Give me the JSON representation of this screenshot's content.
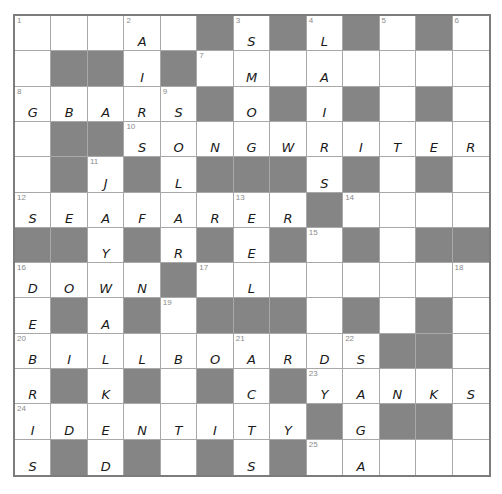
{
  "puzzle": {
    "rows": 13,
    "cols": 13,
    "colors": {
      "block": "#858585",
      "gridline": "#a8a8a8",
      "border": "#7c7c7c",
      "number": "#8a8a8a",
      "letter": "#1a1a1a"
    },
    "grid": [
      [
        {
          "n": "1",
          "l": ""
        },
        {
          "n": "",
          "l": ""
        },
        {
          "n": "",
          "l": ""
        },
        {
          "n": "2",
          "l": "A"
        },
        {
          "n": "",
          "l": ""
        },
        {
          "b": true
        },
        {
          "n": "3",
          "l": "S"
        },
        {
          "b": true
        },
        {
          "n": "4",
          "l": "L"
        },
        {
          "b": true
        },
        {
          "n": "5",
          "l": ""
        },
        {
          "b": true
        },
        {
          "n": "6",
          "l": ""
        }
      ],
      [
        {
          "n": "",
          "l": ""
        },
        {
          "b": true
        },
        {
          "b": true
        },
        {
          "n": "",
          "l": "I"
        },
        {
          "b": true
        },
        {
          "n": "7",
          "l": ""
        },
        {
          "n": "",
          "l": "M"
        },
        {
          "n": "",
          "l": ""
        },
        {
          "n": "",
          "l": "A"
        },
        {
          "n": "",
          "l": ""
        },
        {
          "n": "",
          "l": ""
        },
        {
          "n": "",
          "l": ""
        },
        {
          "n": "",
          "l": ""
        }
      ],
      [
        {
          "n": "8",
          "l": "G"
        },
        {
          "n": "",
          "l": "B"
        },
        {
          "n": "",
          "l": "A"
        },
        {
          "n": "",
          "l": "R"
        },
        {
          "n": "9",
          "l": "S"
        },
        {
          "b": true
        },
        {
          "n": "",
          "l": "O"
        },
        {
          "b": true
        },
        {
          "n": "",
          "l": "I"
        },
        {
          "b": true
        },
        {
          "n": "",
          "l": ""
        },
        {
          "b": true
        },
        {
          "n": "",
          "l": ""
        }
      ],
      [
        {
          "n": "",
          "l": ""
        },
        {
          "b": true
        },
        {
          "b": true
        },
        {
          "n": "10",
          "l": "S"
        },
        {
          "n": "",
          "l": "O"
        },
        {
          "n": "",
          "l": "N"
        },
        {
          "n": "",
          "l": "G"
        },
        {
          "n": "",
          "l": "W"
        },
        {
          "n": "",
          "l": "R"
        },
        {
          "n": "",
          "l": "I"
        },
        {
          "n": "",
          "l": "T"
        },
        {
          "n": "",
          "l": "E"
        },
        {
          "n": "",
          "l": "R"
        }
      ],
      [
        {
          "n": "",
          "l": ""
        },
        {
          "b": true
        },
        {
          "n": "11",
          "l": "J"
        },
        {
          "b": true
        },
        {
          "n": "",
          "l": "L"
        },
        {
          "b": true
        },
        {
          "b": true
        },
        {
          "b": true
        },
        {
          "n": "",
          "l": "S"
        },
        {
          "b": true
        },
        {
          "n": "",
          "l": ""
        },
        {
          "b": true
        },
        {
          "n": "",
          "l": ""
        }
      ],
      [
        {
          "n": "12",
          "l": "S"
        },
        {
          "n": "",
          "l": "E"
        },
        {
          "n": "",
          "l": "A"
        },
        {
          "n": "",
          "l": "F"
        },
        {
          "n": "",
          "l": "A"
        },
        {
          "n": "",
          "l": "R"
        },
        {
          "n": "13",
          "l": "E"
        },
        {
          "n": "",
          "l": "R"
        },
        {
          "b": true
        },
        {
          "n": "14",
          "l": ""
        },
        {
          "n": "",
          "l": ""
        },
        {
          "n": "",
          "l": ""
        },
        {
          "n": "",
          "l": ""
        }
      ],
      [
        {
          "b": true
        },
        {
          "b": true
        },
        {
          "n": "",
          "l": "Y"
        },
        {
          "b": true
        },
        {
          "n": "",
          "l": "R"
        },
        {
          "b": true
        },
        {
          "n": "",
          "l": "E"
        },
        {
          "b": true
        },
        {
          "n": "15",
          "l": ""
        },
        {
          "b": true
        },
        {
          "n": "",
          "l": ""
        },
        {
          "b": true
        },
        {
          "b": true
        }
      ],
      [
        {
          "n": "16",
          "l": "D"
        },
        {
          "n": "",
          "l": "O"
        },
        {
          "n": "",
          "l": "W"
        },
        {
          "n": "",
          "l": "N"
        },
        {
          "b": true
        },
        {
          "n": "17",
          "l": ""
        },
        {
          "n": "",
          "l": "L"
        },
        {
          "n": "",
          "l": ""
        },
        {
          "n": "",
          "l": ""
        },
        {
          "n": "",
          "l": ""
        },
        {
          "n": "",
          "l": ""
        },
        {
          "n": "",
          "l": ""
        },
        {
          "n": "18",
          "l": ""
        }
      ],
      [
        {
          "n": "",
          "l": "E"
        },
        {
          "b": true
        },
        {
          "n": "",
          "l": "A"
        },
        {
          "b": true
        },
        {
          "n": "19",
          "l": ""
        },
        {
          "b": true
        },
        {
          "b": true
        },
        {
          "b": true
        },
        {
          "n": "",
          "l": ""
        },
        {
          "b": true
        },
        {
          "n": "",
          "l": ""
        },
        {
          "b": true
        },
        {
          "n": "",
          "l": ""
        }
      ],
      [
        {
          "n": "20",
          "l": "B"
        },
        {
          "n": "",
          "l": "I"
        },
        {
          "n": "",
          "l": "L"
        },
        {
          "n": "",
          "l": "L"
        },
        {
          "n": "",
          "l": "B"
        },
        {
          "n": "",
          "l": "O"
        },
        {
          "n": "21",
          "l": "A"
        },
        {
          "n": "",
          "l": "R"
        },
        {
          "n": "",
          "l": "D"
        },
        {
          "n": "22",
          "l": "S"
        },
        {
          "b": true
        },
        {
          "b": true
        },
        {
          "n": "",
          "l": ""
        }
      ],
      [
        {
          "n": "",
          "l": "R"
        },
        {
          "b": true
        },
        {
          "n": "",
          "l": "K"
        },
        {
          "b": true
        },
        {
          "n": "",
          "l": ""
        },
        {
          "b": true
        },
        {
          "n": "",
          "l": "C"
        },
        {
          "b": true
        },
        {
          "n": "23",
          "l": "Y"
        },
        {
          "n": "",
          "l": "A"
        },
        {
          "n": "",
          "l": "N"
        },
        {
          "n": "",
          "l": "K"
        },
        {
          "n": "",
          "l": "S"
        }
      ],
      [
        {
          "n": "24",
          "l": "I"
        },
        {
          "n": "",
          "l": "D"
        },
        {
          "n": "",
          "l": "E"
        },
        {
          "n": "",
          "l": "N"
        },
        {
          "n": "",
          "l": "T"
        },
        {
          "n": "",
          "l": "I"
        },
        {
          "n": "",
          "l": "T"
        },
        {
          "n": "",
          "l": "Y"
        },
        {
          "b": true
        },
        {
          "n": "",
          "l": "G"
        },
        {
          "b": true
        },
        {
          "b": true
        },
        {
          "n": "",
          "l": ""
        }
      ],
      [
        {
          "n": "",
          "l": "S"
        },
        {
          "b": true
        },
        {
          "n": "",
          "l": "D"
        },
        {
          "b": true
        },
        {
          "n": "",
          "l": ""
        },
        {
          "b": true
        },
        {
          "n": "",
          "l": "S"
        },
        {
          "b": true
        },
        {
          "n": "25",
          "l": ""
        },
        {
          "n": "",
          "l": "A"
        },
        {
          "n": "",
          "l": ""
        },
        {
          "n": "",
          "l": ""
        },
        {
          "n": "",
          "l": ""
        }
      ]
    ]
  }
}
